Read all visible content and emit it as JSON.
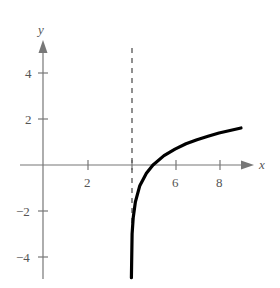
{
  "chart_data": {
    "type": "line",
    "title": "",
    "xlabel": "x",
    "ylabel": "y",
    "xlim": [
      -0.5,
      9.6
    ],
    "ylim": [
      -5,
      5.4
    ],
    "x_ticks": [
      2,
      4,
      6,
      8
    ],
    "x_tick_labels": [
      "2",
      "",
      "6",
      "8"
    ],
    "y_ticks": [
      -4,
      -2,
      2,
      4
    ],
    "y_tick_labels": [
      "-4",
      "-2",
      "2",
      "4"
    ],
    "grid": false,
    "legend": null,
    "asymptote": {
      "type": "vertical",
      "x": 4,
      "style": "dashed"
    },
    "series": [
      {
        "name": "f(x)",
        "style": "solid-thick",
        "color": "#000000",
        "x": [
          4.02,
          4.05,
          4.1,
          4.2,
          4.4,
          4.7,
          5.0,
          5.5,
          6.0,
          6.5,
          7.0,
          7.5,
          8.0,
          8.5,
          9.0
        ],
        "y": [
          -4.9,
          -3.0,
          -2.3,
          -1.6,
          -0.9,
          -0.36,
          0.0,
          0.41,
          0.69,
          0.92,
          1.1,
          1.25,
          1.39,
          1.5,
          1.61
        ]
      }
    ]
  },
  "labels": {
    "x_axis": "x",
    "y_axis": "y",
    "xt2": "2",
    "xt6": "6",
    "xt8": "8",
    "yt4": "4",
    "yt2": "2",
    "ytm2": "−2",
    "ytm4": "−4"
  }
}
